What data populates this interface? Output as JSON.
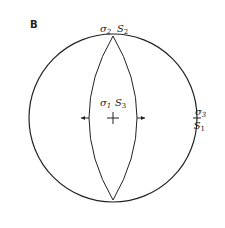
{
  "panel_label": "B",
  "diagram": {
    "type": "stereonet",
    "labels": {
      "top_sigma": "σ",
      "top_sigma_sub": "2",
      "top_s": "S",
      "top_s_sub": "2",
      "center_sigma": "σ",
      "center_sigma_sub": "1",
      "center_s": "S",
      "center_s_sub": "3",
      "right_sigma": "σ",
      "right_sigma_sub": "3",
      "right_s": "S",
      "right_s_sub": "1"
    },
    "line_color": "#222222"
  }
}
